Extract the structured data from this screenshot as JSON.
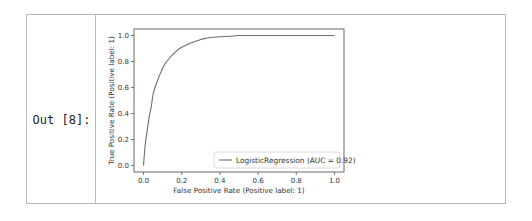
{
  "cell": {
    "prompt": "Out [8]:"
  },
  "chart_data": {
    "type": "line",
    "title": "",
    "xlabel": "False Positive Rate (Positive label: 1)",
    "ylabel": "True Positive Rate (Positive label: 1)",
    "xlim": [
      -0.05,
      1.05
    ],
    "ylim": [
      -0.05,
      1.05
    ],
    "xticks": [
      "0.0",
      "0.2",
      "0.4",
      "0.6",
      "0.8",
      "1.0"
    ],
    "yticks": [
      "0.0",
      "0.2",
      "0.4",
      "0.6",
      "0.8",
      "1.0"
    ],
    "grid": false,
    "legend_position": "lower right",
    "series": [
      {
        "name": "LogisticRegression (AUC = 0.92)",
        "color": "#6e6e6e",
        "x": [
          0.0,
          0.005,
          0.01,
          0.02,
          0.03,
          0.04,
          0.05,
          0.06,
          0.08,
          0.1,
          0.12,
          0.15,
          0.18,
          0.2,
          0.25,
          0.3,
          0.35,
          0.4,
          0.45,
          0.5,
          0.6,
          0.8,
          1.0
        ],
        "y": [
          0.0,
          0.1,
          0.18,
          0.28,
          0.38,
          0.45,
          0.55,
          0.6,
          0.68,
          0.75,
          0.8,
          0.85,
          0.89,
          0.91,
          0.945,
          0.97,
          0.985,
          0.99,
          0.995,
          1.0,
          1.0,
          1.0,
          1.0
        ]
      }
    ],
    "auc": 0.92
  }
}
